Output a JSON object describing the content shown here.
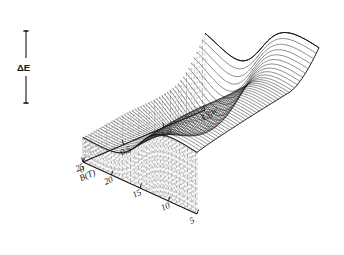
{
  "figure": {
    "kind": "3d-surface-mesh-plot",
    "background": "#ffffff",
    "ink_color": "#141414",
    "vertical_axis": {
      "label": "ΔE",
      "name": "delta-E",
      "has_double_arrow": true
    },
    "left_axis": {
      "name": "B-field-axis",
      "label": "B(T)",
      "ticks": [
        "5",
        "10",
        "15",
        "20",
        "25"
      ]
    },
    "right_axis": {
      "name": "second-axis",
      "unit_label": "1.5 W.",
      "ticks": [
        "0",
        "0.5",
        "1.0",
        "1.5"
      ]
    }
  },
  "chart_data": {
    "type": "surface",
    "title": "",
    "subtitle": "",
    "xlabel": "B(T)",
    "ylabel": "",
    "zlabel": "ΔE",
    "grid": false,
    "legend": null,
    "x_ticks": [
      5,
      10,
      15,
      20,
      25
    ],
    "x_tick_labels": [
      "5",
      "10",
      "15",
      "20",
      "25"
    ],
    "xlim": [
      5,
      25
    ],
    "y_ticks": [
      0,
      0.5,
      1.0,
      1.5
    ],
    "y_tick_labels": [
      "0",
      "0.5",
      "1.0",
      "1.5"
    ],
    "ylim": [
      0,
      1.5
    ],
    "y_unit": "W.",
    "z_axis_label": "ΔE",
    "z_ticks": [],
    "annotations": [
      {
        "text": "ΔE",
        "role": "vertical-scale-bar"
      },
      {
        "text": "B(T)",
        "role": "x-axis-title"
      },
      {
        "text": "1.5 W.",
        "role": "y-axis-unit"
      }
    ],
    "mesh": {
      "n_traces": 46,
      "n_samples_per_trace": 84,
      "plateau_level": 1.0,
      "valley_level": 0.18,
      "step_edge_x": 0.52,
      "saddle_center": [
        0.68,
        0.72
      ]
    }
  }
}
